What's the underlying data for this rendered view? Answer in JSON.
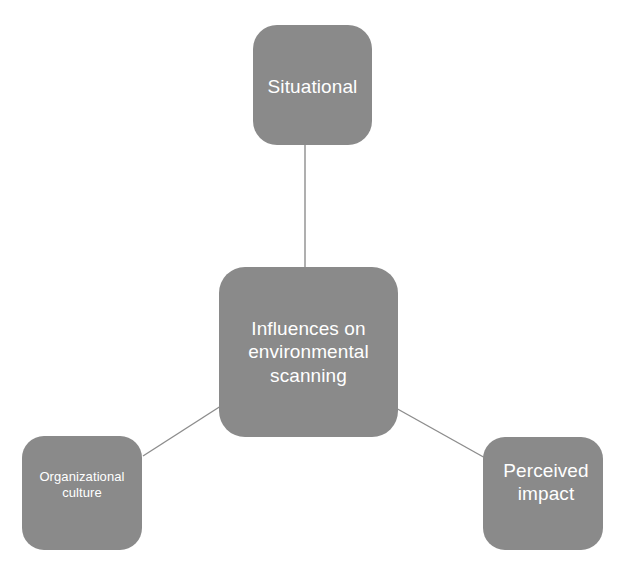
{
  "diagram": {
    "title": "Influences on environmental scanning",
    "type": "hub-and-spoke concept map",
    "background_color": "#ffffff",
    "node_fill_color": "#8a8a8a",
    "node_text_color": "#ffffff",
    "connector_color": "#8d8d8d",
    "center": {
      "id": "center",
      "label": "Influences on\nenvironmental\nscanning"
    },
    "nodes": [
      {
        "id": "situational",
        "label": "Situational",
        "position": "top"
      },
      {
        "id": "organizational-culture",
        "label": "Organizational\nculture",
        "position": "bottom-left"
      },
      {
        "id": "perceived-impact",
        "label": "Perceived\nimpact",
        "position": "bottom-right"
      }
    ],
    "connections": [
      {
        "from": "situational",
        "to": "center"
      },
      {
        "from": "organizational-culture",
        "to": "center"
      },
      {
        "from": "perceived-impact",
        "to": "center"
      }
    ]
  }
}
